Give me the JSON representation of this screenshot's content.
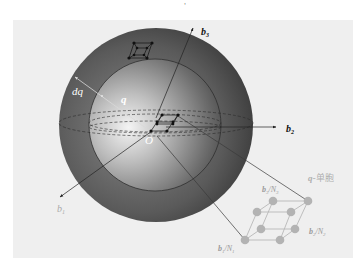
{
  "figure": {
    "top_mark": "'",
    "panel": {
      "background": "#efefef"
    },
    "sphere": {
      "outer_color_dark": "#4a4a4a",
      "inner_color_light": "#e8e8e8",
      "equator_style": "dashed"
    },
    "axes": {
      "b1": {
        "label": "b",
        "sub": "1"
      },
      "b2": {
        "label": "b",
        "sub": "2"
      },
      "b3": {
        "label": "b",
        "sub": "3"
      }
    },
    "origin_label": "O",
    "radius_label": "q",
    "shell_label": "dq",
    "cell_title": "q-单胞",
    "cell_title_q": "q",
    "cell_title_rest": "-单胞",
    "cell_edges": {
      "e1": {
        "b": "b",
        "bsub": "1",
        "n": "N",
        "nsub": "1"
      },
      "e2": {
        "b": "b",
        "bsub": "2",
        "n": "N",
        "nsub": "2"
      },
      "e3": {
        "b": "b",
        "bsub": "3",
        "n": "N",
        "nsub": "3"
      }
    },
    "colors": {
      "axis": "#222222",
      "cell_gray": "#b3b3b3",
      "cell_label": "#9a9a9a",
      "radius_line": "#d8d8d8"
    }
  }
}
